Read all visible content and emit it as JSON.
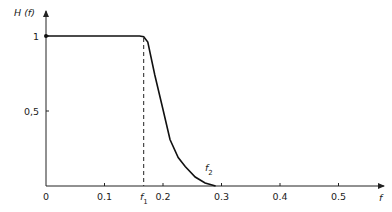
{
  "chart_data": {
    "type": "line",
    "title": "",
    "xlabel": "f",
    "ylabel": "H (f)",
    "xlim": [
      0,
      0.57
    ],
    "ylim": [
      0,
      1.15
    ],
    "grid": false,
    "legend": null,
    "x_ticks": [
      {
        "value": 0,
        "label": "0"
      },
      {
        "value": 0.1,
        "label": "0.1"
      },
      {
        "value": 0.2,
        "label": "0.2"
      },
      {
        "value": 0.3,
        "label": "0.3"
      },
      {
        "value": 0.4,
        "label": "0.4"
      },
      {
        "value": 0.5,
        "label": "0.5"
      }
    ],
    "y_ticks": [
      {
        "value": 0.5,
        "label": "0,5"
      },
      {
        "value": 1,
        "label": "1"
      }
    ],
    "annotations": [
      {
        "text": "f",
        "sub": "1",
        "x": 0.167,
        "note": "dashed vertical line from H=1 down to axis"
      },
      {
        "text": "f",
        "sub": "2",
        "x": 0.29,
        "note": "point where curve reaches zero"
      }
    ],
    "series": [
      {
        "name": "H(f)",
        "x": [
          0,
          0.16,
          0.167,
          0.174,
          0.186,
          0.2,
          0.212,
          0.226,
          0.238,
          0.255,
          0.272,
          0.29
        ],
        "y": [
          1,
          1,
          0.995,
          0.96,
          0.74,
          0.51,
          0.31,
          0.19,
          0.13,
          0.06,
          0.02,
          0
        ]
      }
    ],
    "f1": 0.167,
    "f2": 0.29
  },
  "labels": {
    "y_axis": "H (f)",
    "x_axis": "f",
    "f1_main": "f",
    "f1_sub": "1",
    "f2_main": "f",
    "f2_sub": "2"
  }
}
